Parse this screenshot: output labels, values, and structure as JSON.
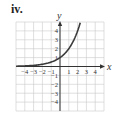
{
  "panel_label": "iv.",
  "chart_data": {
    "type": "line",
    "title": "",
    "xlabel": "x",
    "ylabel": "y",
    "xlim": [
      -5,
      5
    ],
    "ylim": [
      -5,
      5
    ],
    "grid": true,
    "x_ticks": [
      -4,
      -3,
      -2,
      -1,
      1,
      2,
      3,
      4
    ],
    "y_ticks": [
      4,
      3,
      2,
      1,
      -1,
      -2,
      -3,
      -4
    ],
    "x_tick_labels": [
      "−4",
      "−3",
      "−2",
      "−1",
      "1",
      "2",
      "3",
      "4"
    ],
    "y_tick_labels": [
      "4",
      "3",
      "2",
      "1",
      "−1",
      "−2",
      "−3",
      "−4"
    ],
    "series": [
      {
        "name": "y = 2^x",
        "function": "2^x",
        "x": [
          -5,
          -4,
          -3,
          -2,
          -1,
          0,
          1,
          2,
          2.3
        ],
        "y": [
          0.03,
          0.06,
          0.13,
          0.25,
          0.5,
          1,
          2,
          4,
          4.92
        ]
      }
    ],
    "colors": {
      "curve": "#3a3a3a",
      "grid": "#c9c9c9",
      "axis": "#333333"
    }
  }
}
